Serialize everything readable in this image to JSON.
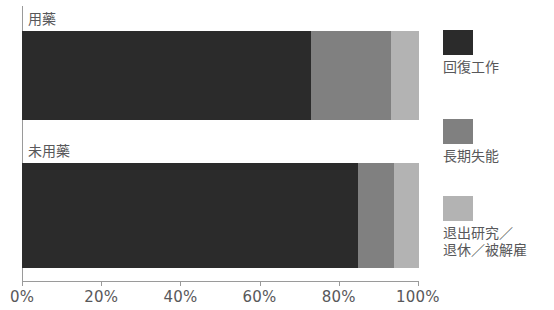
{
  "chart_data": {
    "type": "bar",
    "orientation": "horizontal",
    "stacked": true,
    "stacked_normalized": true,
    "title": "",
    "xlabel": "",
    "ylabel": "",
    "xlim": [
      0,
      100
    ],
    "xticks": [
      0,
      20,
      40,
      60,
      80,
      100
    ],
    "xtick_labels": [
      "0%",
      "20%",
      "40%",
      "60%",
      "80%",
      "100%"
    ],
    "grid": false,
    "legend_position": "right",
    "categories": [
      "用藥",
      "未用藥"
    ],
    "series": [
      {
        "name": "回復工作",
        "color": "#2b2b2b",
        "values": [
          72.7,
          84.6
        ]
      },
      {
        "name": "長期失能",
        "color": "#808080",
        "values": [
          20.2,
          9.1
        ]
      },
      {
        "name": "退出研究／\n退休／被解雇",
        "color": "#b3b3b3",
        "values": [
          7.1,
          6.3
        ]
      }
    ]
  },
  "axis": {
    "ticks": [
      {
        "label": "0%",
        "value": 0
      },
      {
        "label": "20%",
        "value": 20
      },
      {
        "label": "40%",
        "value": 40
      },
      {
        "label": "60%",
        "value": 60
      },
      {
        "label": "80%",
        "value": 80
      },
      {
        "label": "100%",
        "value": 100
      }
    ]
  },
  "legend": {
    "items": [
      {
        "label": "回復工作",
        "color": "#2b2b2b"
      },
      {
        "label": "長期失能",
        "color": "#808080"
      },
      {
        "label": "退出研究／\n退休／被解雇",
        "color": "#b3b3b3"
      }
    ]
  },
  "colors": {
    "series_dark": "#2b2b2b",
    "series_medium": "#808080",
    "series_light": "#b3b3b3",
    "axis": "#9a9a9a",
    "text": "#58585a",
    "background": "#ffffff"
  }
}
